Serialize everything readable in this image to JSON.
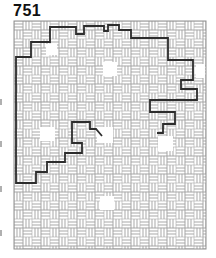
{
  "page": {
    "label": "751",
    "background": "#ffffff",
    "label_color": "#111111"
  },
  "maze": {
    "x": 14,
    "y": 21,
    "width": 192,
    "height": 228,
    "background": "#ffffff",
    "border_color": "#8f8f8f",
    "wall_color": "#a3a3a3",
    "wall_stroke_width": 0.55,
    "brick": {
      "length": 9,
      "width": 3
    },
    "rooms": [
      {
        "x": 46,
        "y": 44,
        "w": 11,
        "h": 11
      },
      {
        "x": 103,
        "y": 62,
        "w": 14,
        "h": 14
      },
      {
        "x": 196,
        "y": 64,
        "w": 9,
        "h": 14
      },
      {
        "x": 40,
        "y": 127,
        "w": 15,
        "h": 14
      },
      {
        "x": 97,
        "y": 127,
        "w": 16,
        "h": 16
      },
      {
        "x": 158,
        "y": 136,
        "w": 15,
        "h": 15
      },
      {
        "x": 100,
        "y": 196,
        "w": 14,
        "h": 14
      }
    ],
    "solution": {
      "color": "#2d2d2d",
      "stroke_width": 1.8,
      "points": [
        [
          102,
          136
        ],
        [
          96,
          129
        ],
        [
          90,
          129
        ],
        [
          90,
          122
        ],
        [
          72,
          122
        ],
        [
          72,
          143
        ],
        [
          82,
          143
        ],
        [
          82,
          153
        ],
        [
          65,
          153
        ],
        [
          65,
          162
        ],
        [
          47,
          162
        ],
        [
          47,
          172
        ],
        [
          36,
          172
        ],
        [
          36,
          183
        ],
        [
          16,
          183
        ],
        [
          16,
          57
        ],
        [
          31,
          57
        ],
        [
          31,
          42
        ],
        [
          50,
          42
        ],
        [
          50,
          27
        ],
        [
          76,
          27
        ],
        [
          76,
          34
        ],
        [
          84,
          34
        ],
        [
          84,
          26
        ],
        [
          104,
          26
        ],
        [
          104,
          31
        ],
        [
          108,
          31
        ],
        [
          108,
          25
        ],
        [
          119,
          25
        ],
        [
          119,
          30
        ],
        [
          131,
          30
        ],
        [
          131,
          38
        ],
        [
          168,
          38
        ],
        [
          168,
          60
        ],
        [
          193,
          60
        ],
        [
          193,
          80
        ],
        [
          181,
          80
        ],
        [
          181,
          89
        ],
        [
          197,
          89
        ],
        [
          197,
          100
        ],
        [
          150,
          100
        ],
        [
          150,
          112
        ],
        [
          175,
          112
        ],
        [
          175,
          124
        ],
        [
          163,
          124
        ],
        [
          163,
          133
        ],
        [
          157,
          133
        ]
      ]
    }
  },
  "artifacts": {
    "color": "#b0b0b0",
    "marks": [
      99,
      141,
      186,
      230
    ]
  }
}
